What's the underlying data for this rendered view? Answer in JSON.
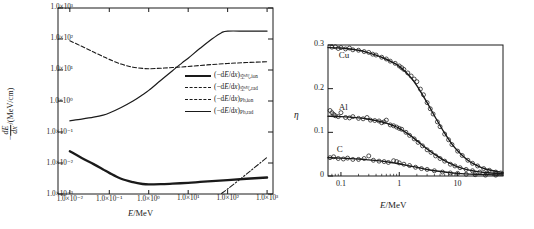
{
  "figure": {
    "panel_count": 2,
    "background": "#ffffff",
    "ink": "#1a1a1a"
  },
  "left_panel": {
    "xaxis": {
      "title_italic": "E",
      "title_rest": "/MeV",
      "ticks": [
        "1.0×10⁻²",
        "1.0×10⁻¹",
        "1.0×10⁰",
        "1.0×10¹",
        "1.0×10²",
        "1.0×10³"
      ],
      "tick_values": [
        -2,
        -1,
        0,
        1,
        2,
        3
      ],
      "scale": "log"
    },
    "yaxis": {
      "title_num": "dE",
      "title_den": "dx",
      "title_prefix": "−",
      "title_suffix": "/(MeV/cm)",
      "ticks": [
        "1.0×10³",
        "1.0×10²",
        "1.0×10¹",
        "1.0×10⁰",
        "1.0×10⁻¹",
        "1.0×10⁻²",
        "1.0×10⁻³"
      ],
      "tick_values": [
        3,
        2,
        1,
        0,
        -1,
        -2,
        -3
      ],
      "scale": "log"
    },
    "legend": [
      {
        "style": "thick-solid",
        "prefix": "(−d",
        "ital1": "E",
        "mid": "/d",
        "ital2": "x",
        "close": ")",
        "subscript": "空气,ion"
      },
      {
        "style": "dash-dot",
        "prefix": "(−d",
        "ital1": "E",
        "mid": "/d",
        "ital2": "x",
        "close": ")",
        "subscript": "空气,rad"
      },
      {
        "style": "dashed",
        "prefix": "(−d",
        "ital1": "E",
        "mid": "/d",
        "ital2": "x",
        "close": ")",
        "subscript": "Pb,ion"
      },
      {
        "style": "thin-solid",
        "prefix": "(−d",
        "ital1": "E",
        "mid": "/d",
        "ital2": "x",
        "close": ")",
        "subscript": "Pb,rad"
      }
    ]
  },
  "right_panel": {
    "xaxis": {
      "title_italic": "E",
      "title_rest": "/MeV",
      "ticks": [
        "0.1",
        "1",
        "10"
      ],
      "tick_values": [
        -1,
        0,
        1
      ],
      "scale": "log"
    },
    "yaxis": {
      "title": "η",
      "ticks": [
        "0.3",
        "0.2",
        "0.1",
        "0"
      ],
      "tick_values": [
        0.3,
        0.2,
        0.1,
        0
      ],
      "scale": "linear",
      "ylim": [
        0,
        0.3
      ]
    },
    "curve_tags": [
      "Cu",
      "Al",
      "C"
    ]
  },
  "chart_data": [
    {
      "type": "line",
      "panel": "left",
      "title": "",
      "xlabel": "E/MeV",
      "ylabel": "-dE/dx /(MeV/cm)",
      "xscale": "log",
      "yscale": "log",
      "xlim": [
        0.01,
        1000
      ],
      "ylim": [
        0.001,
        1000
      ],
      "grid": false,
      "legend_position": "center-right-inside",
      "series": [
        {
          "name": "(-dE/dx) air,ion",
          "style": "thick-solid",
          "x": [
            0.01,
            0.02,
            0.04,
            0.07,
            0.1,
            0.2,
            0.4,
            0.7,
            1.0,
            2.0,
            4.0,
            10,
            20,
            40,
            100,
            300,
            1000
          ],
          "y": [
            0.024,
            0.0145,
            0.0092,
            0.0062,
            0.0048,
            0.0031,
            0.0024,
            0.0021,
            0.00203,
            0.00207,
            0.00216,
            0.0023,
            0.00245,
            0.0026,
            0.0028,
            0.0031,
            0.0034
          ]
        },
        {
          "name": "(-dE/dx) air,rad",
          "style": "dash-dot",
          "x": [
            70,
            100,
            200,
            400,
            700,
            1000
          ],
          "y": [
            0.00105,
            0.00145,
            0.0029,
            0.0059,
            0.0105,
            0.0152
          ]
        },
        {
          "name": "(-dE/dx) Pb,ion",
          "style": "dashed",
          "x": [
            0.01,
            0.02,
            0.04,
            0.07,
            0.1,
            0.2,
            0.4,
            0.7,
            1.0,
            2.0,
            4.0,
            10,
            30,
            100,
            300,
            1000
          ],
          "y": [
            88,
            58,
            38,
            27,
            22,
            15.5,
            12.3,
            11.3,
            11.0,
            11.4,
            12.0,
            13.0,
            14.6,
            16.2,
            17.4,
            18.5
          ]
        },
        {
          "name": "(-dE/dx) Pb,rad",
          "style": "thin-solid",
          "x": [
            0.01,
            0.02,
            0.04,
            0.07,
            0.1,
            0.2,
            0.4,
            0.7,
            1.0,
            2.0,
            4.0,
            7.0,
            10,
            20,
            40,
            70,
            100,
            300,
            1000
          ],
          "y": [
            0.23,
            0.26,
            0.3,
            0.35,
            0.41,
            0.62,
            1.0,
            1.6,
            2.2,
            4.6,
            9.5,
            17,
            24,
            50,
            100,
            160,
            180,
            180,
            180
          ]
        }
      ]
    },
    {
      "type": "scatter",
      "panel": "right",
      "title": "",
      "xlabel": "E/MeV",
      "ylabel": "η",
      "xscale": "log",
      "yscale": "linear",
      "xlim": [
        0.06,
        60
      ],
      "ylim": [
        0,
        0.3
      ],
      "grid": false,
      "legend_position": "inline-labels",
      "series": [
        {
          "name": "Cu",
          "fit_x": [
            0.06,
            0.1,
            0.2,
            0.3,
            0.5,
            0.8,
            1.0,
            1.5,
            2.0,
            3.0,
            4.0,
            6.0,
            8.0,
            10,
            15,
            20,
            30,
            60
          ],
          "fit_y": [
            0.294,
            0.293,
            0.288,
            0.282,
            0.272,
            0.259,
            0.251,
            0.229,
            0.207,
            0.168,
            0.138,
            0.098,
            0.073,
            0.058,
            0.036,
            0.026,
            0.016,
            0.008
          ],
          "points_x": [
            0.07,
            0.08,
            0.09,
            0.1,
            0.12,
            0.14,
            0.16,
            0.2,
            0.25,
            0.3,
            0.35,
            0.4,
            0.5,
            0.6,
            0.7,
            0.85,
            1.0,
            1.1,
            1.2,
            1.4,
            1.6,
            1.8,
            2.0,
            2.3,
            2.6,
            3.0,
            3.4,
            3.8,
            4.5,
            5.0,
            6.0,
            7.0,
            8.0,
            10,
            12,
            15,
            18,
            22,
            28,
            35,
            45,
            55
          ],
          "points_y": [
            0.295,
            0.296,
            0.292,
            0.294,
            0.291,
            0.293,
            0.289,
            0.288,
            0.285,
            0.283,
            0.279,
            0.277,
            0.272,
            0.268,
            0.263,
            0.258,
            0.252,
            0.248,
            0.244,
            0.236,
            0.229,
            0.222,
            0.216,
            0.199,
            0.186,
            0.168,
            0.154,
            0.142,
            0.124,
            0.113,
            0.096,
            0.083,
            0.072,
            0.057,
            0.047,
            0.036,
            0.029,
            0.023,
            0.017,
            0.013,
            0.009,
            0.007
          ]
        },
        {
          "name": "Al",
          "fit_x": [
            0.06,
            0.1,
            0.2,
            0.3,
            0.5,
            0.8,
            1.0,
            1.5,
            2.0,
            3.0,
            4.0,
            6.0,
            8.0,
            10,
            15,
            20,
            30,
            60
          ],
          "fit_y": [
            0.137,
            0.136,
            0.133,
            0.13,
            0.124,
            0.115,
            0.109,
            0.094,
            0.081,
            0.062,
            0.05,
            0.035,
            0.027,
            0.021,
            0.014,
            0.011,
            0.008,
            0.005
          ],
          "points_x": [
            0.065,
            0.07,
            0.075,
            0.08,
            0.09,
            0.1,
            0.12,
            0.14,
            0.16,
            0.2,
            0.24,
            0.28,
            0.32,
            0.38,
            0.45,
            0.5,
            0.55,
            0.6,
            0.7,
            0.8,
            0.9,
            1.0,
            1.1,
            1.3,
            1.5,
            1.8,
            2.1,
            2.5,
            3.0,
            3.5,
            4.2,
            5.0,
            6.0,
            7.5,
            9.0,
            11,
            14,
            18,
            24,
            32,
            45
          ],
          "points_y": [
            0.15,
            0.145,
            0.141,
            0.138,
            0.136,
            0.145,
            0.134,
            0.133,
            0.136,
            0.132,
            0.131,
            0.134,
            0.128,
            0.127,
            0.126,
            0.122,
            0.124,
            0.128,
            0.117,
            0.115,
            0.112,
            0.109,
            0.107,
            0.1,
            0.093,
            0.085,
            0.077,
            0.069,
            0.06,
            0.054,
            0.046,
            0.04,
            0.034,
            0.027,
            0.023,
            0.019,
            0.015,
            0.012,
            0.009,
            0.007,
            0.005
          ]
        },
        {
          "name": "C",
          "fit_x": [
            0.06,
            0.1,
            0.2,
            0.3,
            0.5,
            0.8,
            1.0,
            1.5,
            2.0,
            3.0,
            4.0,
            6.0,
            10,
            20,
            60
          ],
          "fit_y": [
            0.042,
            0.041,
            0.039,
            0.037,
            0.034,
            0.03,
            0.028,
            0.023,
            0.02,
            0.015,
            0.012,
            0.009,
            0.006,
            0.004,
            0.002
          ],
          "points_x": [
            0.065,
            0.075,
            0.09,
            0.11,
            0.13,
            0.16,
            0.2,
            0.25,
            0.3,
            0.36,
            0.45,
            0.55,
            0.65,
            0.8,
            0.9,
            1.0,
            1.2,
            1.5,
            1.9,
            2.4,
            3.0,
            4.0,
            5.5,
            7.5,
            10,
            14,
            20,
            30,
            45
          ],
          "points_y": [
            0.042,
            0.044,
            0.04,
            0.039,
            0.041,
            0.038,
            0.038,
            0.04,
            0.046,
            0.036,
            0.034,
            0.033,
            0.031,
            0.035,
            0.033,
            0.03,
            0.027,
            0.024,
            0.02,
            0.017,
            0.015,
            0.012,
            0.009,
            0.007,
            0.006,
            0.004,
            0.003,
            0.002,
            0.002
          ]
        }
      ]
    }
  ]
}
